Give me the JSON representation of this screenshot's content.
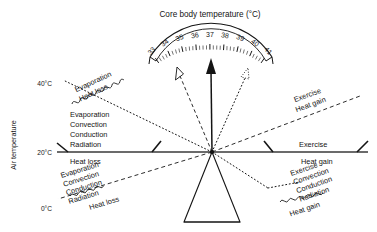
{
  "figure": {
    "gauge_title": "Core body temperature (°C)",
    "y_axis_label": "Air temperature",
    "y_ticks": [
      "40°C",
      "20°C",
      "0°C"
    ],
    "gauge_numbers": [
      "33",
      "34",
      "35",
      "36",
      "37",
      "38",
      "39",
      "40",
      "41"
    ],
    "needle_value": "37"
  },
  "arms": {
    "upper_left": {
      "mechanisms": "Evaporation",
      "effect": "Heat loss"
    },
    "middle_left": {
      "mechanisms": [
        "Evaporation",
        "Convection",
        "Conduction",
        "Radiation"
      ],
      "effect": "Heat loss"
    },
    "lower_left": {
      "mechanisms": [
        "Evaporation",
        "Convection",
        "Conduction",
        "Radiation"
      ],
      "effect": "Heat loss"
    },
    "upper_right": {
      "mechanisms": "Exercise",
      "effect": "Heat gain"
    },
    "middle_right": {
      "mechanisms": "Exercise",
      "effect": "Heat gain"
    },
    "lower_right": {
      "mechanisms": [
        "Exercise",
        "Convection",
        "Conduction",
        "Radiation"
      ],
      "effect": "Heat gain"
    }
  },
  "colors": {
    "ink": "#141414",
    "background": "#ffffff"
  }
}
